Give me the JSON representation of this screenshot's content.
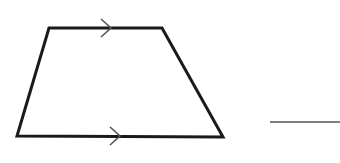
{
  "figure": {
    "type": "trapezoid",
    "vertices": {
      "top_left": [
        49,
        28
      ],
      "top_right": [
        162,
        28
      ],
      "bottom_right": [
        223,
        137
      ],
      "bottom_left": [
        17,
        136
      ]
    },
    "parallel_marks": [
      {
        "side": "top",
        "tip": [
          111,
          28
        ],
        "arm1": [
          101,
          19
        ],
        "arm2": [
          101,
          37
        ]
      },
      {
        "side": "bottom",
        "tip": [
          120,
          136
        ],
        "arm1": [
          110,
          127
        ],
        "arm2": [
          110,
          145
        ]
      }
    ],
    "stroke_color": "#1a1a1a",
    "mark_color": "#555555"
  },
  "answer_blank": {
    "x1": 270,
    "x2": 340,
    "y": 122,
    "color": "#555555"
  }
}
